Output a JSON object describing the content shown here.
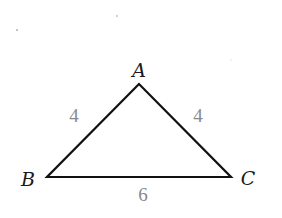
{
  "diagram": {
    "type": "triangle",
    "vertices": [
      {
        "name": "A",
        "x": 139,
        "y": 84,
        "label_x": 139,
        "label_y": 77
      },
      {
        "name": "B",
        "x": 47,
        "y": 177,
        "label_x": 28,
        "label_y": 186
      },
      {
        "name": "C",
        "x": 231,
        "y": 177,
        "label_x": 248,
        "label_y": 185
      }
    ],
    "sides": [
      {
        "name": "AB",
        "length": "4",
        "label_x": 74,
        "label_y": 122
      },
      {
        "name": "AC",
        "length": "4",
        "label_x": 198,
        "label_y": 122
      },
      {
        "name": "BC",
        "length": "6",
        "label_x": 143,
        "label_y": 201
      }
    ],
    "colors": {
      "edge": "#111111",
      "vertex_label": "#1a1a1a",
      "side_label": "#8a8a8a"
    }
  }
}
